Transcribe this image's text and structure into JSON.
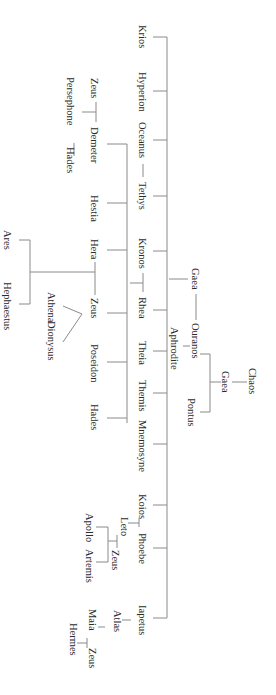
{
  "diagram": {
    "orientation": "rotated 90 degrees clockwise",
    "line_color": "#8a8a8a",
    "text_color": "#2a2a2a",
    "background": "#ffffff",
    "primordials": {
      "chaos": "Chaos",
      "gaea_child_of_chaos": "Gaea",
      "ouranos": "Ouranos",
      "pontus": "Pontus",
      "gaea_spouse": "Gaea",
      "aphrodite": "Aphrodite"
    },
    "titans": [
      {
        "label": "Krios"
      },
      {
        "label": "Hyperion"
      },
      {
        "label": "Oceanus"
      },
      {
        "label": "Tethys"
      },
      {
        "label": "Kronos"
      },
      {
        "label": "Rhea"
      },
      {
        "label": "Theia"
      },
      {
        "label": "Themis"
      },
      {
        "label": "Mnemosyne"
      },
      {
        "label": "Koios"
      },
      {
        "label": "Phoebe"
      },
      {
        "label": "Iapetus"
      }
    ],
    "olympians": [
      {
        "label": "Demeter"
      },
      {
        "label": "Hestia"
      },
      {
        "label": "Hera"
      },
      {
        "label": "Zeus"
      },
      {
        "label": "Poseidon"
      },
      {
        "label": "Hades"
      }
    ],
    "demeter_branch": {
      "zeus": "Zeus",
      "persephone": "Persephone",
      "hades": "Hades"
    },
    "hera_zeus_children": {
      "ares": "Ares",
      "hephaestus": "Hephaestus"
    },
    "zeus_children": {
      "athena": "Athena",
      "dionysus": "Dionysus"
    },
    "phoebe_branch": {
      "leto": "Leto",
      "zeus": "Zeus",
      "apollo": "Apollo",
      "artemis": "Artemis"
    },
    "iapetus_branch": {
      "atlas": "Atlas",
      "maia": "Maia",
      "zeus": "Zeus",
      "hermes": "Hermes"
    }
  }
}
